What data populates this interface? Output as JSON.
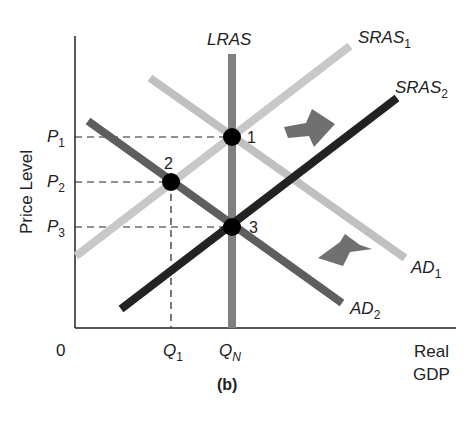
{
  "figure": {
    "panel_label": "(b)",
    "y_axis_label": "Price Level",
    "x_axis_label_line1": "Real",
    "x_axis_label_line2": "GDP",
    "origin_label": "0"
  },
  "price_ticks": [
    {
      "base": "P",
      "sub": "1"
    },
    {
      "base": "P",
      "sub": "2"
    },
    {
      "base": "P",
      "sub": "3"
    }
  ],
  "quantity_ticks": [
    {
      "base": "Q",
      "sub": "1"
    },
    {
      "base": "Q",
      "sub": "N"
    }
  ],
  "curves": {
    "lras": {
      "label": "LRAS",
      "color": "#7a7a7a"
    },
    "sras1": {
      "base": "SRAS",
      "sub": "1",
      "color": "#c8c8c8"
    },
    "sras2": {
      "base": "SRAS",
      "sub": "2",
      "color": "#222222"
    },
    "ad1": {
      "base": "AD",
      "sub": "1",
      "color": "#bdbdbd"
    },
    "ad2": {
      "base": "AD",
      "sub": "2",
      "color": "#5e5e5e"
    }
  },
  "points": [
    {
      "label": "1"
    },
    {
      "label": "2"
    },
    {
      "label": "3"
    }
  ],
  "arrows": {
    "sras_shift": "right",
    "ad_shift": "left",
    "color": "#6f6f6f"
  }
}
